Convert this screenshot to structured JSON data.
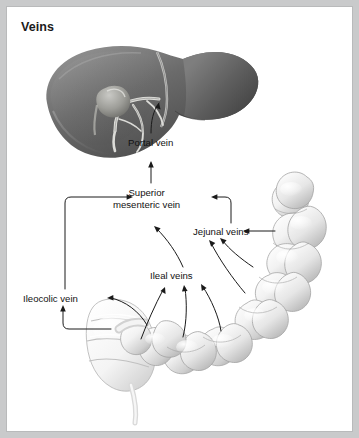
{
  "figure": {
    "title": "Veins",
    "frame_color": "#c9cacb",
    "panel_background": "#ffffff",
    "label_color": "#121212",
    "connector_color": "#1a1a1a"
  },
  "labels": {
    "portal_vein": "Portal vein",
    "superior_mesenteric_vein_line1": "Superior",
    "superior_mesenteric_vein_line2": "mesenteric vein",
    "jejunal_veins": "Jejunal veins",
    "ileal_veins": "Ileal veins",
    "ileocolic_vein": "Ileocolic vein"
  },
  "anatomy": {
    "liver": {
      "name": "liver-illustration",
      "fill_dark": "#4f4f4f",
      "fill_mid": "#6e6e6e",
      "fill_light": "#8f8f8f",
      "vessel_color": "#d8d8d4"
    },
    "small_intestine": {
      "name": "small-intestine-illustration",
      "fill_light": "#f7f7f7",
      "fill_shadow": "#b9b9b9",
      "outline": "#9a9a9a"
    },
    "cecum": {
      "name": "cecum-illustration",
      "fill_light": "#fbfbfb",
      "fill_shadow": "#c4c4c4"
    }
  },
  "flow": {
    "description": "Venous drainage of the intestines to the liver",
    "edges": [
      {
        "from": "Superior mesenteric vein",
        "to": "Portal vein"
      },
      {
        "from": "Portal vein",
        "to": "liver"
      },
      {
        "from": "Ileocolic vein",
        "to": "Superior mesenteric vein"
      },
      {
        "from": "Jejunal veins",
        "to": "Superior mesenteric vein"
      },
      {
        "from": "Ileal veins",
        "to": "Superior mesenteric vein"
      },
      {
        "from": "jejunum",
        "to": "Jejunal veins"
      },
      {
        "from": "ileum",
        "to": "Ileal veins"
      },
      {
        "from": "cecum",
        "to": "Ileocolic vein"
      }
    ]
  }
}
